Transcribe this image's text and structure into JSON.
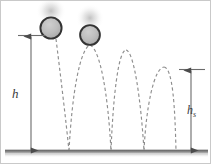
{
  "figure": {
    "labels": {
      "drop_height": "h",
      "bounce_height_base": "h",
      "bounce_height_sub": "s"
    },
    "colors": {
      "ground": "#8a8a8a",
      "ground_edge": "#4a4a4a",
      "trajectory": "#8e8e8e",
      "ball_fill": "#b4b4b4",
      "ball_outline": "#333333",
      "dimension_line": "#6b6b6b",
      "frame": "#c9c9c9",
      "label_text": "#3a3a3a",
      "background": "#ffffff"
    },
    "elements": {
      "ball_positions": [
        {
          "name": "ball-initial",
          "cx": 50,
          "cy": 27,
          "r": 11
        },
        {
          "name": "ball-first-apex",
          "cx": 89,
          "cy": 34,
          "r": 10
        }
      ],
      "ground_line_y": 151,
      "bounce_points_x": [
        68,
        110,
        143,
        174
      ],
      "arc_peaks": [
        {
          "x": 89,
          "y": 34
        },
        {
          "x": 125,
          "y": 49
        },
        {
          "x": 163,
          "y": 66
        }
      ],
      "drop_dimension": {
        "x": 30,
        "top_y": 35,
        "bottom_y": 150
      },
      "bounce_dimension": {
        "x": 190,
        "top_y": 69,
        "bottom_y": 150
      }
    }
  }
}
